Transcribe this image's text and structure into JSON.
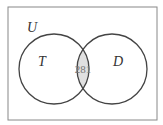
{
  "diagram": {
    "type": "venn",
    "universe_label": "U",
    "sets": [
      {
        "label": "T"
      },
      {
        "label": "D"
      }
    ],
    "intersection_value": "281",
    "colors": {
      "stroke": "#444444",
      "intersection_fill": "#e0e0e0",
      "border": "#888888"
    }
  }
}
